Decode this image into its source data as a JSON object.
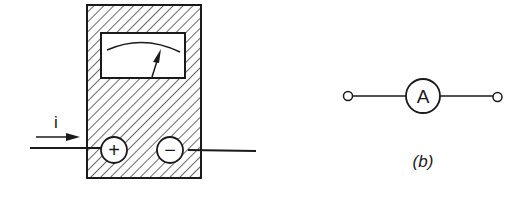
{
  "figure_a": {
    "current_label": "i",
    "positive_terminal": "+",
    "negative_terminal": "−"
  },
  "figure_b": {
    "symbol_letter": "A",
    "caption": "(b)"
  },
  "colors": {
    "stroke": "#1a1a1a",
    "background": "#ffffff"
  }
}
